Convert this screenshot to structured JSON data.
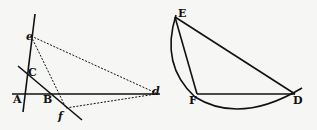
{
  "figure_left": {
    "labels": {
      "A": "A",
      "B": "B",
      "C": "C",
      "e": "e",
      "f": "f",
      "d": "d"
    }
  },
  "figure_right": {
    "labels": {
      "E": "E",
      "F": "F",
      "D": "D"
    }
  },
  "colors": {
    "ink": "#111111",
    "paper": "#f6f6f4"
  }
}
